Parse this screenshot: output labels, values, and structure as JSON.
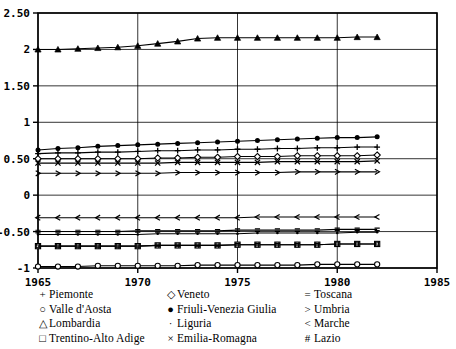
{
  "chart_data": {
    "type": "line",
    "title": "",
    "xlabel": "",
    "ylabel": "",
    "xlim": [
      1965,
      1985
    ],
    "ylim": [
      -1,
      2.5
    ],
    "xticks": [
      1965,
      1970,
      1975,
      1980,
      1985
    ],
    "xticklabels": [
      "1965",
      "1970",
      "1975",
      "1980",
      "1985"
    ],
    "yticks": [
      -1,
      -0.5,
      0,
      0.5,
      1,
      1.5,
      2,
      2.5
    ],
    "yticklabels": [
      "-1",
      "-0.50",
      "0",
      "0.50",
      "1",
      "1.50",
      "2",
      "2.50"
    ],
    "grid": "horizontal-and-vertical-at-ticks",
    "legend_position": "below-axes-three-columns",
    "x": [
      1965,
      1966,
      1967,
      1968,
      1969,
      1970,
      1971,
      1972,
      1973,
      1974,
      1975,
      1976,
      1977,
      1978,
      1979,
      1980,
      1981,
      1982
    ],
    "series": [
      {
        "name": "Piemonte",
        "marker": "+",
        "values": [
          0.57,
          0.58,
          0.58,
          0.59,
          0.59,
          0.6,
          0.61,
          0.61,
          0.62,
          0.62,
          0.63,
          0.63,
          0.64,
          0.64,
          0.65,
          0.65,
          0.66,
          0.66
        ]
      },
      {
        "name": "Valle d'Aosta",
        "marker": "○",
        "values": [
          -0.98,
          -0.98,
          -0.98,
          -0.97,
          -0.97,
          -0.97,
          -0.97,
          -0.97,
          -0.96,
          -0.96,
          -0.96,
          -0.96,
          -0.96,
          -0.96,
          -0.95,
          -0.95,
          -0.95,
          -0.95
        ]
      },
      {
        "name": "Lombardia",
        "marker": "△",
        "values": [
          2.0,
          2.0,
          2.01,
          2.02,
          2.03,
          2.05,
          2.08,
          2.11,
          2.15,
          2.16,
          2.16,
          2.16,
          2.16,
          2.16,
          2.16,
          2.16,
          2.17,
          2.17
        ]
      },
      {
        "name": "Trentino-Alto Adige",
        "marker": "□",
        "values": [
          -0.7,
          -0.7,
          -0.7,
          -0.7,
          -0.7,
          -0.7,
          -0.69,
          -0.69,
          -0.69,
          -0.69,
          -0.68,
          -0.68,
          -0.68,
          -0.68,
          -0.68,
          -0.67,
          -0.67,
          -0.67
        ]
      },
      {
        "name": "Veneto",
        "marker": "◇",
        "values": [
          0.5,
          0.5,
          0.5,
          0.5,
          0.5,
          0.5,
          0.51,
          0.51,
          0.52,
          0.52,
          0.53,
          0.53,
          0.53,
          0.54,
          0.54,
          0.54,
          0.54,
          0.55
        ]
      },
      {
        "name": "Friuli-Venezia Giulia",
        "marker": "●",
        "values": [
          0.62,
          0.64,
          0.65,
          0.67,
          0.68,
          0.69,
          0.7,
          0.71,
          0.72,
          0.73,
          0.74,
          0.75,
          0.76,
          0.77,
          0.78,
          0.79,
          0.79,
          0.8
        ]
      },
      {
        "name": "Liguria",
        "marker": "·",
        "values": [
          -0.54,
          -0.54,
          -0.54,
          -0.54,
          -0.54,
          -0.54,
          -0.53,
          -0.53,
          -0.53,
          -0.53,
          -0.53,
          -0.52,
          -0.52,
          -0.52,
          -0.52,
          -0.52,
          -0.51,
          -0.51
        ]
      },
      {
        "name": "Emilia-Romagna",
        "marker": "×",
        "values": [
          0.44,
          0.44,
          0.44,
          0.44,
          0.44,
          0.44,
          0.44,
          0.45,
          0.45,
          0.45,
          0.45,
          0.45,
          0.46,
          0.46,
          0.46,
          0.46,
          0.46,
          0.47
        ]
      },
      {
        "name": "Toscana",
        "marker": "=",
        "values": [
          -0.5,
          -0.5,
          -0.5,
          -0.5,
          -0.5,
          -0.49,
          -0.49,
          -0.49,
          -0.49,
          -0.49,
          -0.48,
          -0.48,
          -0.48,
          -0.48,
          -0.48,
          -0.47,
          -0.47,
          -0.47
        ]
      },
      {
        "name": "Umbria",
        "marker": ">",
        "values": [
          0.3,
          0.3,
          0.3,
          0.3,
          0.3,
          0.3,
          0.3,
          0.31,
          0.31,
          0.31,
          0.31,
          0.31,
          0.31,
          0.32,
          0.32,
          0.32,
          0.32,
          0.32
        ]
      },
      {
        "name": "Marche",
        "marker": "<",
        "values": [
          -0.31,
          -0.31,
          -0.31,
          -0.31,
          -0.31,
          -0.31,
          -0.31,
          -0.31,
          -0.31,
          -0.31,
          -0.31,
          -0.3,
          -0.3,
          -0.3,
          -0.3,
          -0.3,
          -0.3,
          -0.3
        ]
      },
      {
        "name": "Lazio",
        "marker": "#",
        "values": [
          -0.7,
          -0.7,
          -0.7,
          -0.7,
          -0.7,
          -0.7,
          -0.69,
          -0.69,
          -0.69,
          -0.69,
          -0.68,
          -0.68,
          -0.68,
          -0.68,
          -0.68,
          -0.67,
          -0.67,
          -0.67
        ]
      }
    ]
  },
  "legend": {
    "columns": [
      {
        "items": [
          {
            "marker": "+",
            "label": "Piemonte"
          },
          {
            "marker": "○",
            "label": "Valle d'Aosta"
          },
          {
            "marker": "△",
            "label": "Lombardia"
          },
          {
            "marker": "□",
            "label": "Trentino-Alto Adige"
          }
        ]
      },
      {
        "items": [
          {
            "marker": "◇",
            "label": "Veneto"
          },
          {
            "marker": "●",
            "label": "Friuli-Venezia Giulia"
          },
          {
            "marker": "·",
            "label": "Liguria"
          },
          {
            "marker": "×",
            "label": "Emilia-Romagna"
          }
        ]
      },
      {
        "items": [
          {
            "marker": "=",
            "label": "Toscana"
          },
          {
            "marker": ">",
            "label": "Umbria"
          },
          {
            "marker": "<",
            "label": "Marche"
          },
          {
            "marker": "#",
            "label": "Lazio"
          }
        ]
      }
    ]
  },
  "colors": {
    "line": "#000000",
    "frame": "#000000",
    "grid": "#000000",
    "background": "#ffffff"
  }
}
